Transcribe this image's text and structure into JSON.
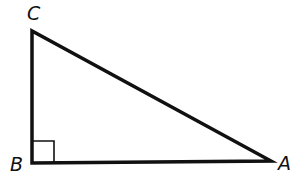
{
  "diagram": {
    "type": "right-triangle",
    "vertices": [
      {
        "name": "C",
        "x": 32,
        "y": 31,
        "label_x": 27,
        "label_y": 20
      },
      {
        "name": "B",
        "x": 32,
        "y": 163,
        "label_x": 10,
        "label_y": 171
      },
      {
        "name": "A",
        "x": 271,
        "y": 161,
        "label_x": 280,
        "label_y": 170
      }
    ],
    "right_angle_at": "B",
    "right_angle_marker_size": 21,
    "stroke_color": "#111111",
    "stroke_width": 3.5
  }
}
